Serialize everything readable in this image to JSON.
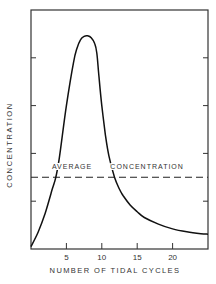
{
  "chart_data": {
    "type": "line",
    "title": "",
    "xlabel": "NUMBER OF TIDAL CYCLES",
    "ylabel": "CONCENTRATION",
    "xlim": [
      0,
      25
    ],
    "ylim": [
      0,
      5
    ],
    "x_ticks": [
      5,
      10,
      15,
      20
    ],
    "x_tick_labels": [
      "5",
      "10",
      "15",
      "20"
    ],
    "y_ticks": [
      1,
      2,
      3,
      4
    ],
    "y_tick_labels": [
      "",
      "",
      "",
      ""
    ],
    "grid": false,
    "series": [
      {
        "name": "Concentration",
        "style": "solid",
        "x": [
          0,
          1,
          2,
          3,
          3.5,
          4,
          5,
          6,
          6.5,
          7,
          7.5,
          8,
          8.5,
          9,
          9.3,
          9.6,
          10,
          10.5,
          11,
          11.8,
          12.5,
          13,
          14,
          15,
          16,
          18,
          20,
          22,
          24,
          25
        ],
        "values": [
          0.05,
          0.35,
          0.75,
          1.25,
          1.5,
          1.9,
          3.0,
          3.9,
          4.2,
          4.38,
          4.45,
          4.46,
          4.42,
          4.3,
          4.1,
          3.6,
          3.0,
          2.4,
          1.95,
          1.5,
          1.25,
          1.12,
          0.92,
          0.78,
          0.66,
          0.52,
          0.42,
          0.36,
          0.32,
          0.31
        ]
      },
      {
        "name": "Average Concentration",
        "style": "dashed",
        "x": [
          0,
          25
        ],
        "values": [
          1.5,
          1.5
        ]
      }
    ],
    "annotations": [
      {
        "text": "AVERAGE",
        "x": 5.8,
        "y": 1.62
      },
      {
        "text": "CONCENTRATION",
        "x": 16.4,
        "y": 1.62
      }
    ],
    "legend": "none"
  }
}
